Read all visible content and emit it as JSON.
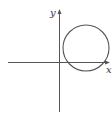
{
  "diagram": {
    "type": "coordinate-plane-with-circle",
    "colors": {
      "background": "#ffffff",
      "stroke": "#555555",
      "label": "#333333"
    },
    "axes": {
      "x_label": "x",
      "y_label": "y",
      "origin_px": [
        59,
        62
      ]
    },
    "circle": {
      "center_px": [
        86,
        48
      ],
      "radius_px": 23,
      "description": "Circle in the first quadrant, not touching the y-axis, crossing the x-axis slightly (part dips below x-axis)"
    }
  }
}
